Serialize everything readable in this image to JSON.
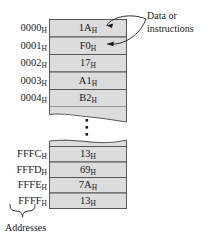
{
  "figure": {
    "type": "memory-map-diagram",
    "cell_fill_color": "#dcdcdc",
    "line_color": "#555555",
    "text_color": "#1a1a1a"
  },
  "annotation": {
    "line1": "Data or",
    "line2": "instructions",
    "pointer_targets": [
      "1A",
      "F0"
    ]
  },
  "addresses_caption": "Addresses",
  "ellipsis": "⋮",
  "hex_subscript": "H",
  "top_block": {
    "rows": [
      {
        "address": "0000",
        "value": "1A"
      },
      {
        "address": "0001",
        "value": "F0"
      },
      {
        "address": "0002",
        "value": "17"
      },
      {
        "address": "0003",
        "value": "A1"
      },
      {
        "address": "0004",
        "value": "B2"
      }
    ]
  },
  "bottom_block": {
    "rows": [
      {
        "address": "FFFC",
        "value": "13"
      },
      {
        "address": "FFFD",
        "value": "69"
      },
      {
        "address": "FFFE",
        "value": "7A"
      },
      {
        "address": "FFFF",
        "value": "13"
      }
    ]
  }
}
